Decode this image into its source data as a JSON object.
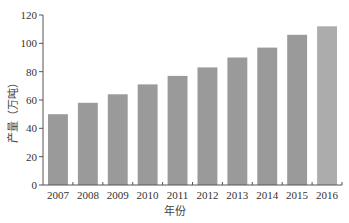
{
  "chart_data": {
    "type": "bar",
    "title": "",
    "xlabel": "年份",
    "ylabel": "产量（万吨）",
    "categories": [
      "2007",
      "2008",
      "2009",
      "2010",
      "2011",
      "2012",
      "2013",
      "2014",
      "2015",
      "2016"
    ],
    "values": [
      50,
      58,
      64,
      71,
      77,
      83,
      90,
      97,
      106,
      112
    ],
    "ylim": [
      0,
      120
    ],
    "yticks": [
      0,
      20,
      40,
      60,
      80,
      100,
      120
    ],
    "grid": false,
    "legend": null,
    "colors": {
      "bar": "#9a9a9a",
      "bar_highlight": "#acacac",
      "axis": "#555555"
    },
    "highlight_index": 9
  }
}
